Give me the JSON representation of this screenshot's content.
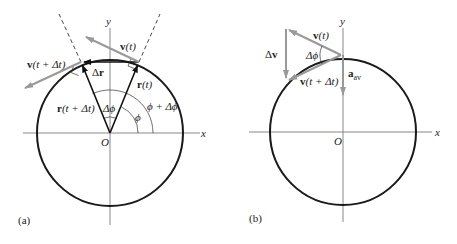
{
  "figure": {
    "panels": [
      {
        "id": "a",
        "caption": "(a)",
        "axes": {
          "x_label": "x",
          "y_label": "y",
          "origin_label": "O"
        },
        "labels": {
          "v_t": "v(t)",
          "v_t_dt": "v(t + Δt)",
          "delta_r": "Δr",
          "r_t": "r(t)",
          "r_t_dt": "r(t + Δt)",
          "delta_phi": "Δϕ",
          "phi": "ϕ",
          "phi_plus_delta_phi": "ϕ + Δϕ"
        }
      },
      {
        "id": "b",
        "caption": "(b)",
        "axes": {
          "x_label": "x",
          "y_label": "y",
          "origin_label": "O"
        },
        "labels": {
          "v_t": "v(t)",
          "v_t_dt": "v(t + Δt)",
          "delta_v": "Δv",
          "delta_phi": "Δϕ",
          "a_av_main": "a",
          "a_av_sub": "av"
        }
      }
    ],
    "colors": {
      "circle": "#1a1a1a",
      "axes": "#777777",
      "velocity": "#999999",
      "radius": "#111111"
    }
  }
}
